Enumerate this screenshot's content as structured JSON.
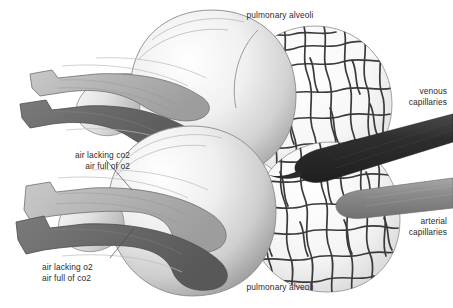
{
  "figure": {
    "background_color": "#ffffff",
    "text_color": "#2b2b2b"
  },
  "labels": {
    "pulmonary_alveoli_top": "pulmonary alveoli",
    "pulmonary_alveoli_bottom": "pulmonary alveoli",
    "venous_capillaries": "venous\ncapillaries",
    "arterial_capillaries": "arterial\ncapillaries",
    "air_lacking_co2": "air lacking co2\nair full of o2",
    "air_lacking_o2": "air lacking o2\nair full of co2"
  },
  "colors": {
    "alveolus_light": "#fbfbfb",
    "alveolus_mid": "#d8d8d8",
    "alveolus_shadow": "#a8a8a8",
    "capillary_line": "#3a3a3a",
    "capillary_sphere": "#f2f2f2",
    "airflow_light": "#b9b9b9",
    "airflow_dark": "#6e6e6e",
    "venous_vessel": "#333333",
    "arterial_vessel": "#8c8c8c",
    "outline": "#6a6a6a",
    "leader_line": "#4a4a4a"
  },
  "elements": {
    "alveolus_upper": "upper pulmonary alveolus sac",
    "alveolus_lower": "lower pulmonary alveolus sac",
    "capillary_network_upper": "upper alveolar capillary network",
    "capillary_network_lower": "lower alveolar capillary network",
    "airflow_in_upper": "oxygen-rich inspired air band, upper airway",
    "airflow_out_upper": "carbon-dioxide-rich expired air band, upper airway",
    "airflow_in_lower": "oxygen-rich inspired air band, lower airway",
    "airflow_out_lower": "carbon-dioxide-rich expired air band, lower airway",
    "vessel_venous": "venous capillary vessel entering from right",
    "vessel_arterial": "arterial capillary vessel exiting to right"
  }
}
